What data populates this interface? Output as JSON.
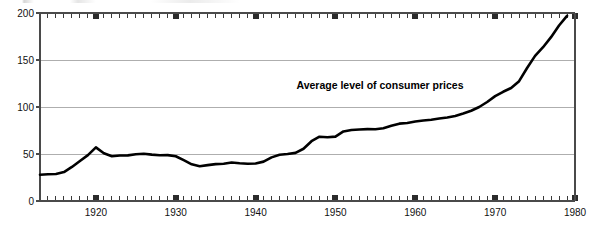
{
  "figure": {
    "background_color": "#ffffff",
    "ylabel": "1967 = 100",
    "annotation": "Average level of consumer prices"
  },
  "chart_data": {
    "type": "line",
    "title": "",
    "subtitle": "",
    "annotations": [
      "Average level of consumer prices"
    ],
    "xlabel": "",
    "ylabel": "1967 = 100",
    "xlim": [
      1913,
      1980
    ],
    "ylim": [
      0,
      200
    ],
    "xticks_major": [
      1920,
      1930,
      1940,
      1950,
      1960,
      1970,
      1980
    ],
    "xtick_labels": [
      "1920",
      "1930",
      "1940",
      "1950",
      "1960",
      "1970",
      "1980"
    ],
    "xticks_minor_step": 1,
    "yticks": [
      0,
      50,
      100,
      150,
      200
    ],
    "ytick_labels": [
      "0",
      "50",
      "100",
      "150",
      "200"
    ],
    "grid": "horizontal",
    "grid_color": "#9a9a9a",
    "line_color": "#000000",
    "line_width": 2.6,
    "marker_style": "square",
    "marker_color": "#2b2b2b",
    "axis_color": "#4a4a4a",
    "legend": "none",
    "x": [
      1913,
      1914,
      1915,
      1916,
      1917,
      1918,
      1919,
      1920,
      1921,
      1922,
      1923,
      1924,
      1925,
      1926,
      1927,
      1928,
      1929,
      1930,
      1931,
      1932,
      1933,
      1934,
      1935,
      1936,
      1937,
      1938,
      1939,
      1940,
      1941,
      1942,
      1943,
      1944,
      1945,
      1946,
      1947,
      1948,
      1949,
      1950,
      1951,
      1952,
      1953,
      1954,
      1955,
      1956,
      1957,
      1958,
      1959,
      1960,
      1961,
      1962,
      1963,
      1964,
      1965,
      1966,
      1967,
      1968,
      1969,
      1970,
      1971,
      1972,
      1973,
      1974,
      1975,
      1976,
      1977,
      1978,
      1979
    ],
    "values": [
      28.0,
      28.4,
      28.7,
      30.8,
      36.2,
      42.5,
      48.8,
      57.0,
      50.8,
      47.6,
      48.4,
      48.5,
      49.7,
      50.2,
      49.3,
      48.7,
      48.8,
      47.6,
      43.4,
      39.0,
      37.0,
      38.2,
      39.2,
      39.6,
      41.0,
      40.2,
      39.6,
      39.9,
      41.9,
      46.4,
      49.2,
      50.0,
      51.2,
      55.6,
      63.6,
      68.4,
      67.8,
      68.5,
      74.0,
      75.6,
      76.1,
      76.5,
      76.3,
      77.4,
      80.0,
      82.3,
      82.9,
      84.5,
      85.6,
      86.5,
      87.7,
      88.9,
      90.4,
      93.1,
      96.0,
      100.0,
      105.3,
      111.6,
      116.2,
      120.2,
      127.5,
      141.5,
      154.4,
      163.6,
      174.3,
      186.7,
      197.0
    ],
    "data_notes": "US consumer price index, annual average, base 1967 = 100"
  },
  "axes_geometry": {
    "plot_left_px": 40,
    "plot_right_px": 575,
    "plot_top_px": 13,
    "plot_bottom_px": 201
  }
}
